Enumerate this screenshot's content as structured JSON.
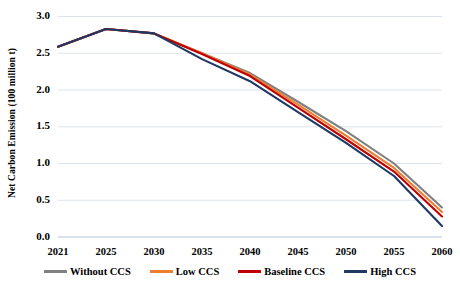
{
  "chart_data": {
    "type": "line",
    "title": "",
    "xlabel": "",
    "ylabel": "Net Carbon Emission (100 million t)",
    "categories": [
      "2021",
      "2025",
      "2030",
      "2035",
      "2040",
      "2045",
      "2050",
      "2055",
      "2060"
    ],
    "x": [
      2021,
      2025,
      2030,
      2035,
      2040,
      2045,
      2050,
      2055,
      2060
    ],
    "ylim": [
      0.0,
      3.0
    ],
    "yticks": [
      "0.0",
      "0.5",
      "1.0",
      "1.5",
      "2.0",
      "2.5",
      "3.0"
    ],
    "ytick_values": [
      0.0,
      0.5,
      1.0,
      1.5,
      2.0,
      2.5,
      3.0
    ],
    "grid": true,
    "legend_position": "bottom",
    "series": [
      {
        "name": "Without CCS",
        "color": "#808080",
        "values": [
          2.59,
          2.83,
          2.77,
          2.5,
          2.23,
          1.84,
          1.44,
          1.0,
          0.4
        ]
      },
      {
        "name": "Low CCS",
        "color": "#ED7D31",
        "values": [
          2.59,
          2.83,
          2.77,
          2.5,
          2.21,
          1.8,
          1.38,
          0.94,
          0.34
        ]
      },
      {
        "name": "Baseline CCS",
        "color": "#C00000",
        "values": [
          2.59,
          2.83,
          2.77,
          2.49,
          2.19,
          1.76,
          1.33,
          0.89,
          0.28
        ]
      },
      {
        "name": "High CCS",
        "color": "#1F3864",
        "values": [
          2.59,
          2.83,
          2.77,
          2.42,
          2.12,
          1.7,
          1.28,
          0.83,
          0.15
        ]
      }
    ]
  },
  "axes": {
    "y_title": "Net Carbon Emission (100 million t)"
  }
}
